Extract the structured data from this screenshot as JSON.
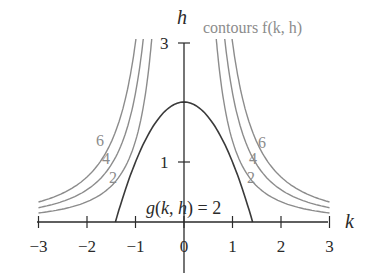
{
  "chart_data": {
    "type": "line",
    "title": "",
    "xlabel": "k",
    "ylabel": "h",
    "xlim": [
      -3,
      3
    ],
    "ylim": [
      0,
      3
    ],
    "x_ticks": [
      "−3",
      "−2",
      "−1",
      "0",
      "1",
      "2",
      "3"
    ],
    "y_ticks": [
      "1",
      "3"
    ],
    "grid": false,
    "legend_text": "contours f(k, h)",
    "series": [
      {
        "name": "contour f(k,h) = 2",
        "label": "2",
        "style": "gray",
        "form": "h = c/k^2",
        "c": 1.35
      },
      {
        "name": "contour f(k,h) = 4",
        "label": "4",
        "style": "gray",
        "form": "h = c/k^2",
        "c": 2.15
      },
      {
        "name": "contour f(k,h) = 6",
        "label": "6",
        "style": "gray",
        "form": "h = c/k^2",
        "c": 3.0
      },
      {
        "name": "g(k, h) = 2",
        "label": "g(k, h) = 2",
        "style": "dark",
        "form": "h = 2 - k^2",
        "points": [
          [
            -1.41,
            0
          ],
          [
            -1,
            1
          ],
          [
            -0.5,
            1.75
          ],
          [
            0,
            2
          ],
          [
            0.5,
            1.75
          ],
          [
            1,
            1
          ],
          [
            1.41,
            0
          ]
        ]
      }
    ],
    "constraint_label": "g(k, h) = 2"
  }
}
